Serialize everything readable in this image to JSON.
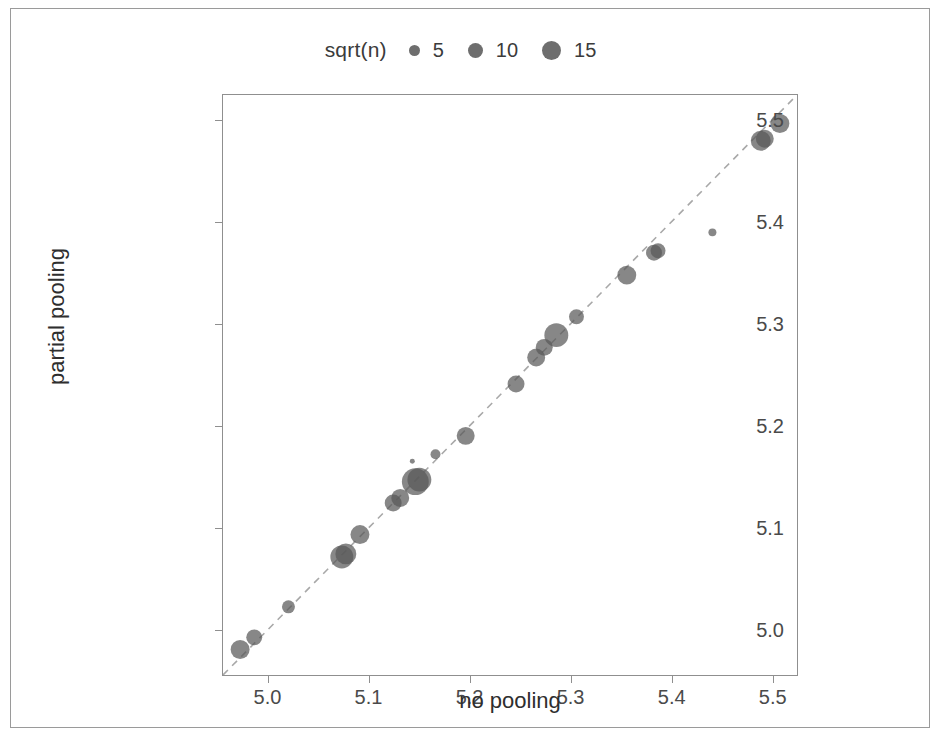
{
  "chart_data": {
    "type": "scatter",
    "title": "",
    "xlabel": "no pooling",
    "ylabel": "partial pooling",
    "xlim": [
      4.955,
      5.525
    ],
    "ylim": [
      4.955,
      5.525
    ],
    "xticks": [
      "5.0",
      "5.1",
      "5.2",
      "5.3",
      "5.4",
      "5.5"
    ],
    "xtick_values": [
      5.0,
      5.1,
      5.2,
      5.3,
      5.4,
      5.5
    ],
    "yticks": [
      "5.0",
      "5.1",
      "5.2",
      "5.3",
      "5.4",
      "5.5"
    ],
    "ytick_values": [
      5.0,
      5.1,
      5.2,
      5.3,
      5.4,
      5.5
    ],
    "grid": false,
    "point_color": "#595959",
    "point_opacity": 0.72,
    "reference_line": {
      "kind": "identity",
      "style": "dashed",
      "color": "#a8a8a8",
      "from": [
        4.955,
        4.955
      ],
      "to": [
        5.525,
        5.525
      ]
    },
    "size_legend": {
      "title": "sqrt(n)",
      "position": "top",
      "orientation": "horizontal",
      "breaks": [
        5,
        10,
        15
      ],
      "labels": [
        "5",
        "10",
        "15"
      ],
      "marker_diameters_px": [
        11,
        15,
        19
      ]
    },
    "points": [
      {
        "x": 4.972,
        "y": 4.98,
        "size": 9.5
      },
      {
        "x": 4.986,
        "y": 4.992,
        "size": 8.0
      },
      {
        "x": 5.02,
        "y": 5.022,
        "size": 6.5
      },
      {
        "x": 5.073,
        "y": 5.071,
        "size": 11.5
      },
      {
        "x": 5.077,
        "y": 5.074,
        "size": 10.5
      },
      {
        "x": 5.091,
        "y": 5.093,
        "size": 9.5
      },
      {
        "x": 5.124,
        "y": 5.124,
        "size": 8.5
      },
      {
        "x": 5.131,
        "y": 5.129,
        "size": 9.0
      },
      {
        "x": 5.146,
        "y": 5.145,
        "size": 13.5
      },
      {
        "x": 5.15,
        "y": 5.147,
        "size": 12.0
      },
      {
        "x": 5.143,
        "y": 5.165,
        "size": 2.5
      },
      {
        "x": 5.166,
        "y": 5.172,
        "size": 5.0
      },
      {
        "x": 5.196,
        "y": 5.19,
        "size": 9.0
      },
      {
        "x": 5.246,
        "y": 5.241,
        "size": 8.5
      },
      {
        "x": 5.266,
        "y": 5.267,
        "size": 9.0
      },
      {
        "x": 5.274,
        "y": 5.277,
        "size": 8.5
      },
      {
        "x": 5.286,
        "y": 5.289,
        "size": 12.0
      },
      {
        "x": 5.306,
        "y": 5.307,
        "size": 7.5
      },
      {
        "x": 5.356,
        "y": 5.348,
        "size": 9.5
      },
      {
        "x": 5.383,
        "y": 5.37,
        "size": 8.0
      },
      {
        "x": 5.387,
        "y": 5.372,
        "size": 7.5
      },
      {
        "x": 5.441,
        "y": 5.39,
        "size": 4.0
      },
      {
        "x": 5.489,
        "y": 5.48,
        "size": 10.0
      },
      {
        "x": 5.493,
        "y": 5.482,
        "size": 9.0
      },
      {
        "x": 5.508,
        "y": 5.497,
        "size": 9.5
      }
    ]
  }
}
